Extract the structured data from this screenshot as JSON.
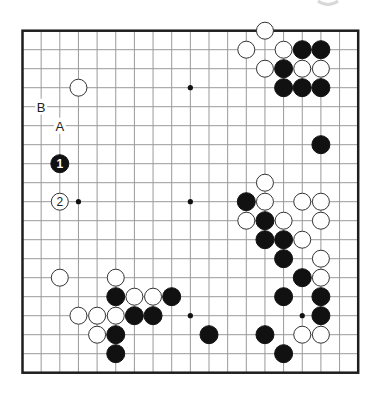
{
  "board": {
    "size": 19,
    "origin": {
      "x": 22.5,
      "y": 30.7
    },
    "spacing": {
      "x": 18.65,
      "y": 19.0
    },
    "stone_radius": 9,
    "colors": {
      "grid": "#9a9a9a",
      "border": "#1e1e1e",
      "black": "#111111",
      "white": "#ffffff"
    },
    "star_points": [
      [
        3,
        3
      ],
      [
        9,
        3
      ],
      [
        15,
        3
      ],
      [
        3,
        9
      ],
      [
        9,
        9
      ],
      [
        15,
        9
      ],
      [
        3,
        15
      ],
      [
        9,
        15
      ],
      [
        15,
        15
      ]
    ],
    "black_stones": [
      [
        15,
        1
      ],
      [
        16,
        1
      ],
      [
        14,
        2
      ],
      [
        14,
        3
      ],
      [
        15,
        3
      ],
      [
        16,
        3
      ],
      [
        16,
        6
      ],
      [
        12,
        9
      ],
      [
        13,
        10
      ],
      [
        13,
        11
      ],
      [
        14,
        11
      ],
      [
        14,
        12
      ],
      [
        15,
        13
      ],
      [
        14,
        14
      ],
      [
        16,
        14
      ],
      [
        16,
        15
      ],
      [
        13,
        16
      ],
      [
        14,
        17
      ],
      [
        5,
        14
      ],
      [
        8,
        14
      ],
      [
        6,
        15
      ],
      [
        7,
        15
      ],
      [
        5,
        16
      ],
      [
        10,
        16
      ],
      [
        5,
        17
      ]
    ],
    "white_stones": [
      [
        13,
        0
      ],
      [
        12,
        1
      ],
      [
        14,
        1
      ],
      [
        13,
        2
      ],
      [
        15,
        2
      ],
      [
        16,
        2
      ],
      [
        3,
        3
      ],
      [
        13,
        8
      ],
      [
        13,
        9
      ],
      [
        15,
        9
      ],
      [
        16,
        9
      ],
      [
        12,
        10
      ],
      [
        14,
        10
      ],
      [
        16,
        10
      ],
      [
        15,
        11
      ],
      [
        16,
        12
      ],
      [
        16,
        13
      ],
      [
        15,
        16
      ],
      [
        16,
        16
      ],
      [
        2,
        13
      ],
      [
        5,
        13
      ],
      [
        6,
        14
      ],
      [
        7,
        14
      ],
      [
        3,
        15
      ],
      [
        4,
        15
      ],
      [
        5,
        15
      ],
      [
        4,
        16
      ]
    ],
    "numbered_stones": [
      {
        "col": 2,
        "row": 7,
        "color": "black",
        "number": "1"
      },
      {
        "col": 2,
        "row": 9,
        "color": "white",
        "number": "2"
      }
    ],
    "labels": [
      {
        "col": 1,
        "row": 4,
        "text": "B"
      },
      {
        "col": 2,
        "row": 5,
        "text": "A"
      }
    ]
  }
}
